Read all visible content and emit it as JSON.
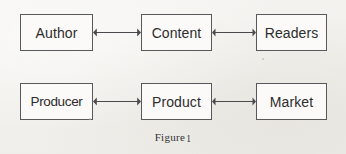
{
  "figure": {
    "caption_prefix": "Figure",
    "caption_number": "1",
    "background_color": "#f2f1ee",
    "box_border_color": "#59585a",
    "box_fill_color": "#fbfaf8",
    "arrow_color": "#4a4a4c",
    "text_color": "#2d2c2e"
  },
  "rows": [
    {
      "name": "editorial-chain",
      "nodes": [
        {
          "label": "Author",
          "x": 20,
          "y": 14,
          "w": 73,
          "h": 37
        },
        {
          "label": "Content",
          "x": 141,
          "y": 14,
          "w": 71,
          "h": 37
        },
        {
          "label": "Readers",
          "x": 256,
          "y": 14,
          "w": 71,
          "h": 37
        }
      ],
      "connectors": [
        {
          "name": "author-content-arrow",
          "from": "Author",
          "to": "Content",
          "x": 93,
          "y": 27,
          "w": 48,
          "type": "double-headed-arrow"
        },
        {
          "name": "content-readers-arrow",
          "from": "Content",
          "to": "Readers",
          "x": 212,
          "y": 27,
          "w": 44,
          "type": "double-headed-arrow"
        }
      ]
    },
    {
      "name": "commercial-chain",
      "nodes": [
        {
          "label": "Producer",
          "x": 20,
          "y": 83,
          "w": 73,
          "h": 37
        },
        {
          "label": "Product",
          "x": 141,
          "y": 83,
          "w": 71,
          "h": 37
        },
        {
          "label": "Market",
          "x": 256,
          "y": 83,
          "w": 71,
          "h": 37
        }
      ],
      "connectors": [
        {
          "name": "producer-product-arrow",
          "from": "Producer",
          "to": "Product",
          "x": 93,
          "y": 96,
          "w": 48,
          "type": "double-headed-arrow"
        },
        {
          "name": "product-market-arrow",
          "from": "Product",
          "to": "Market",
          "x": 212,
          "y": 96,
          "w": 44,
          "type": "double-headed-arrow"
        }
      ]
    }
  ],
  "caption_position": {
    "y": 131
  }
}
